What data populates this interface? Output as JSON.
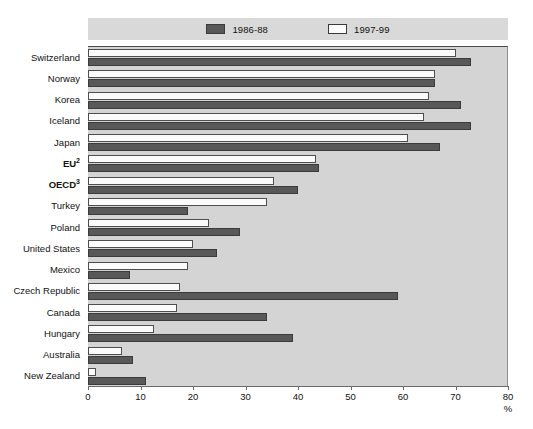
{
  "chart_data": {
    "type": "bar",
    "orientation": "horizontal",
    "title": "",
    "xlabel": "%",
    "ylabel": "",
    "xlim": [
      0,
      80
    ],
    "xticks": [
      0,
      10,
      20,
      30,
      40,
      50,
      60,
      70,
      80
    ],
    "grid": false,
    "legend_position": "top",
    "categories": [
      "Switzerland",
      "Norway",
      "Korea",
      "Iceland",
      "Japan",
      "EU",
      "OECD",
      "Turkey",
      "Poland",
      "United States",
      "Mexico",
      "Czech Republic",
      "Canada",
      "Hungary",
      "Australia",
      "New Zealand"
    ],
    "category_footnotes": {
      "EU": "2",
      "OECD": "3"
    },
    "bold_categories": [
      "EU",
      "OECD"
    ],
    "series": [
      {
        "name": "1986-88",
        "color": "#585858",
        "values": [
          73,
          66,
          71,
          73,
          67,
          44,
          40,
          19,
          29,
          24.5,
          8,
          59,
          34,
          39,
          8.5,
          11
        ]
      },
      {
        "name": "1997-99",
        "color": "#fbfbfb",
        "values": [
          70,
          66,
          65,
          64,
          61,
          43.5,
          35.5,
          34,
          23,
          20,
          19,
          17.5,
          17,
          12.5,
          6.5,
          1.5
        ]
      }
    ]
  },
  "legend": {
    "entries": [
      {
        "label": "1986-88",
        "swatch": "dark"
      },
      {
        "label": "1997-99",
        "swatch": "light"
      }
    ]
  },
  "axis": {
    "unit": "%"
  }
}
